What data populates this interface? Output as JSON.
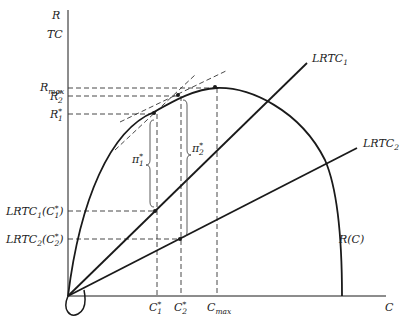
{
  "diagram": {
    "type": "economics-revenue-cost-diagram",
    "axes": {
      "y_label_top": "R",
      "y_label_bottom": "TC",
      "x_label": "C"
    },
    "y_ticks": [
      {
        "id": "rmax",
        "base": "R",
        "sub": "max",
        "sup": ""
      },
      {
        "id": "r2",
        "base": "R",
        "sub": "2",
        "sup": "*"
      },
      {
        "id": "r1",
        "base": "R",
        "sub": "1",
        "sup": "*"
      },
      {
        "id": "lrtc1c1",
        "base": "LRTC",
        "sub": "1",
        "paren": "(C",
        "psub": "1",
        "psup": "*",
        "close": ")"
      },
      {
        "id": "lrtc2c2",
        "base": "LRTC",
        "sub": "2",
        "paren": "(C",
        "psub": "2",
        "psup": "*",
        "close": ")"
      }
    ],
    "x_ticks": [
      {
        "id": "c1",
        "base": "C",
        "sub": "1",
        "sup": "*"
      },
      {
        "id": "c2",
        "base": "C",
        "sub": "2",
        "sup": "*"
      },
      {
        "id": "cmax",
        "base": "C",
        "sub": "max",
        "sup": ""
      }
    ],
    "curves": {
      "revenue": {
        "label": "R(C)"
      },
      "lrtc1": {
        "base": "LRTC",
        "sub": "1"
      },
      "lrtc2": {
        "base": "LRTC",
        "sub": "2"
      }
    },
    "profit_braces": [
      {
        "id": "pi1",
        "base": "π",
        "sub": "1",
        "sup": "*"
      },
      {
        "id": "pi2",
        "base": "π",
        "sub": "2",
        "sup": "*"
      }
    ],
    "colors": {
      "ink": "#1a1a1a",
      "dash": "#333333",
      "background": "#ffffff"
    }
  }
}
